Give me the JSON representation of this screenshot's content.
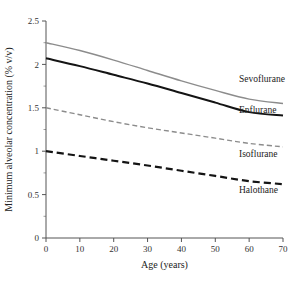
{
  "chart_data": {
    "type": "line",
    "title": "",
    "xlabel": "Age (years)",
    "ylabel": "Minimum alveolar concentration (% v/v)",
    "xlim": [
      0,
      70
    ],
    "ylim": [
      0,
      2.5
    ],
    "xticks": [
      0,
      10,
      20,
      30,
      40,
      50,
      60,
      70
    ],
    "xtick_labels": [
      "0",
      "10",
      "20",
      "30",
      "40",
      "50",
      "60",
      "70"
    ],
    "yticks": [
      0,
      0.5,
      1,
      1.5,
      2,
      2.5
    ],
    "ytick_labels": [
      "0",
      "0.5",
      "1",
      "1.5",
      "2",
      "2.5"
    ],
    "y_minor_ticks": [
      0.25,
      0.75,
      1.25,
      1.75,
      2.25
    ],
    "grid": false,
    "legend_position": "inline-right-of-curve",
    "x": [
      0,
      10,
      20,
      30,
      40,
      50,
      60,
      70
    ],
    "series": [
      {
        "name": "Sevoflurane",
        "color": "#8c8c8c",
        "style": "solid",
        "width": 1.4,
        "values": [
          2.25,
          2.16,
          2.05,
          1.93,
          1.81,
          1.7,
          1.6,
          1.55
        ],
        "label_x": 57,
        "label_y": 1.8
      },
      {
        "name": "Enflurane",
        "color": "#141414",
        "style": "solid",
        "width": 2.0,
        "values": [
          2.07,
          1.98,
          1.88,
          1.78,
          1.67,
          1.56,
          1.45,
          1.41
        ],
        "label_x": 57,
        "label_y": 1.44
      },
      {
        "name": "Isoflurane",
        "color": "#8c8c8c",
        "style": "dashed",
        "width": 1.4,
        "dash": "5,3",
        "values": [
          1.5,
          1.42,
          1.34,
          1.27,
          1.21,
          1.15,
          1.09,
          1.05
        ],
        "label_x": 57,
        "label_y": 0.93
      },
      {
        "name": "Halothane",
        "color": "#141414",
        "style": "dashed",
        "width": 2.2,
        "dash": "7,4",
        "values": [
          1.0,
          0.945,
          0.89,
          0.835,
          0.775,
          0.715,
          0.655,
          0.62
        ],
        "label_x": 57,
        "label_y": 0.52
      }
    ]
  },
  "axes": {
    "x_title": "Age (years)",
    "y_title": "Minimum alveolar concentration (% v/v)"
  }
}
